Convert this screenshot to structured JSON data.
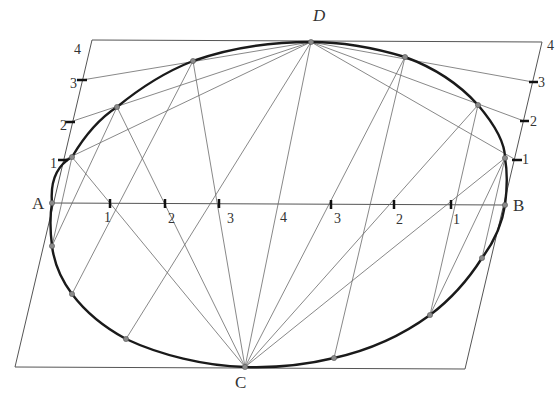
{
  "diagram": {
    "points": {
      "A": {
        "label": "A",
        "x": 52,
        "y": 203,
        "label_x": 32,
        "label_y": 209
      },
      "B": {
        "label": "B",
        "x": 505,
        "y": 205,
        "label_x": 513,
        "label_y": 211
      },
      "C": {
        "label": "C",
        "x": 245,
        "y": 367,
        "label_x": 235,
        "label_y": 388
      },
      "D": {
        "label": "D",
        "x": 311,
        "y": 42,
        "label_x": 313,
        "label_y": 21
      }
    },
    "parallelogram": {
      "top_left": [
        92,
        40
      ],
      "top_right": [
        542,
        42
      ],
      "bottom_right": [
        465,
        369
      ],
      "bottom_left": [
        15,
        367
      ]
    },
    "axis_ticks": [
      {
        "label": "1",
        "x": 110,
        "label_x": 104,
        "label_y": 222
      },
      {
        "label": "2",
        "x": 165,
        "label_x": 168,
        "label_y": 223
      },
      {
        "label": "3",
        "x": 219,
        "label_x": 227,
        "label_y": 223
      },
      {
        "label": "4",
        "x": 276,
        "label_x": 280,
        "label_y": 222
      },
      {
        "label": "3",
        "x": 331,
        "label_x": 334,
        "label_y": 223
      },
      {
        "label": "2",
        "x": 394,
        "label_x": 396,
        "label_y": 224
      },
      {
        "label": "1",
        "x": 451,
        "label_x": 453,
        "label_y": 224
      }
    ],
    "left_edge_ticks": [
      {
        "label": "1",
        "x": 64,
        "y": 160,
        "label_x": 50,
        "label_y": 168
      },
      {
        "label": "2",
        "x": 70,
        "y": 122,
        "label_x": 60,
        "label_y": 130
      },
      {
        "label": "3",
        "x": 82,
        "y": 80,
        "label_x": 70,
        "label_y": 88
      },
      {
        "label": "4",
        "x": null,
        "y": null,
        "label_x": 74,
        "label_y": 54
      }
    ],
    "right_edge_ticks": [
      {
        "label": "1",
        "x": 516,
        "y": 160,
        "label_x": 522,
        "label_y": 164
      },
      {
        "label": "2",
        "x": 524,
        "y": 121,
        "label_x": 530,
        "label_y": 126
      },
      {
        "label": "3",
        "x": 533,
        "y": 82,
        "label_x": 538,
        "label_y": 87
      },
      {
        "label": "4",
        "x": null,
        "y": null,
        "label_x": 547,
        "label_y": 50
      }
    ],
    "upper_curve_points": [
      [
        72,
        157
      ],
      [
        117,
        107
      ],
      [
        193,
        61
      ],
      [
        405,
        57
      ],
      [
        478,
        105
      ],
      [
        505,
        158
      ]
    ],
    "lower_curve_points": [
      [
        52,
        246
      ],
      [
        72,
        294
      ],
      [
        126,
        339
      ],
      [
        334,
        358
      ],
      [
        430,
        315
      ],
      [
        482,
        258
      ]
    ],
    "colors": {
      "curve": "#1a1a1a",
      "construction": "#6a6a6a",
      "frame": "#555555",
      "background": "#ffffff"
    }
  }
}
